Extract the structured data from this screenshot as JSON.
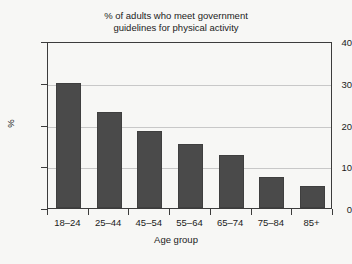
{
  "chart_data": {
    "type": "bar",
    "title": "% of adults who meet government\nguidelines for physical activity",
    "xlabel": "Age group",
    "ylabel": "%",
    "categories": [
      "18–24",
      "25–44",
      "45–54",
      "55–64",
      "65–74",
      "75–84",
      "85+"
    ],
    "values": [
      30.0,
      23.0,
      18.4,
      15.4,
      12.8,
      7.4,
      5.4
    ],
    "ylim": [
      0,
      40
    ],
    "yticks": [
      0,
      10,
      20,
      30,
      40
    ],
    "ytick_labels": [
      "0",
      "10",
      "20",
      "30",
      "40"
    ],
    "grid": true,
    "grid_axis": "y",
    "legend": false,
    "bar_color": "#4a4a4a",
    "background_color": "#f7f7f5",
    "axis_color": "#3c3c3c",
    "gridline_color": "#c8c8c8"
  }
}
